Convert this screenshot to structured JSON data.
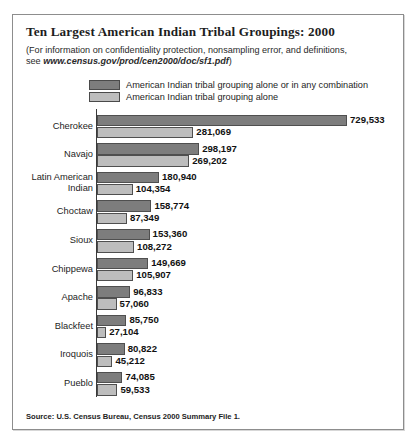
{
  "figure": {
    "title": "Ten Largest American Indian Tribal Groupings: 2000",
    "subtitle_line1": "(For information on confidentiality protection, nonsampling error, and definitions,",
    "subtitle_line2_prefix": "see ",
    "subtitle_url": "www.census.gov/prod/cen2000/doc/sf1.pdf",
    "subtitle_line2_suffix": ")",
    "source": "Source: U.S. Census Bureau, Census 2000 Summary File 1.",
    "colors": {
      "series_alone_or_combination": "#7d7d7d",
      "series_alone": "#bdbdbd",
      "bar_border": "#4f4f4f",
      "axis": "#3a3a3a",
      "frame": "#8d8d8d",
      "text": "#1d1d1d",
      "background": "#ffffff"
    }
  },
  "legend": {
    "items": [
      {
        "label": "American Indian tribal grouping alone or in any combination",
        "swatch": "dark"
      },
      {
        "label": "American Indian tribal grouping alone",
        "swatch": "light"
      }
    ]
  },
  "chart_data": {
    "type": "bar",
    "orientation": "horizontal",
    "title": "Ten Largest American Indian Tribal Groupings: 2000",
    "subtitle": "(For information on confidentiality protection, nonsampling error, and definitions, see www.census.gov/prod/cen2000/doc/sf1.pdf)",
    "xlabel": "",
    "ylabel": "",
    "grid": false,
    "legend_position": "top",
    "xlim": [
      0,
      729533
    ],
    "categories": [
      "Cherokee",
      "Navajo",
      "Latin American Indian",
      "Choctaw",
      "Sioux",
      "Chippewa",
      "Apache",
      "Blackfeet",
      "Iroquois",
      "Pueblo"
    ],
    "series": [
      {
        "name": "American Indian tribal grouping alone or in any combination",
        "color": "#7d7d7d",
        "values": [
          729533,
          298197,
          180940,
          158774,
          153360,
          149669,
          96833,
          85750,
          80822,
          74085
        ],
        "labels": [
          "729,533",
          "298,197",
          "180,940",
          "158,774",
          "153,360",
          "149,669",
          "96,833",
          "85,750",
          "80,822",
          "74,085"
        ]
      },
      {
        "name": "American Indian tribal grouping alone",
        "color": "#bdbdbd",
        "values": [
          281069,
          269202,
          104354,
          87349,
          108272,
          105907,
          57060,
          27104,
          45212,
          59533
        ],
        "labels": [
          "281,069",
          "269,202",
          "104,354",
          "87,349",
          "108,272",
          "105,907",
          "57,060",
          "27,104",
          "45,212",
          "59,533"
        ]
      }
    ],
    "source": "Source: U.S. Census Bureau, Census 2000 Summary File 1."
  }
}
